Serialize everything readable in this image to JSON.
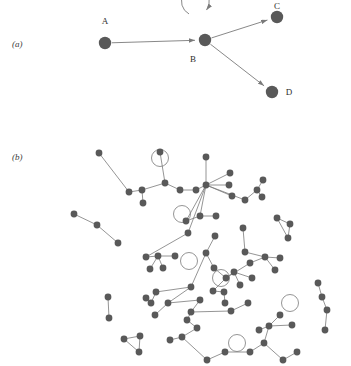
{
  "figure": {
    "width": 351,
    "height": 366,
    "background": "#ffffff",
    "node_color": "#595959",
    "edge_color": "#7a7a7a",
    "label_color": "#2e2e2e",
    "panel_label_color": "#3a3a3a"
  },
  "panels": [
    {
      "id": "a",
      "label": "(a)",
      "label_x": 12,
      "label_y": 47,
      "description": "directed graph with four labelled vertices and a self-loop",
      "node_radius": 6.2,
      "edge_width": 0.9,
      "nodes": [
        {
          "id": "A",
          "label": "A",
          "x": 105,
          "y": 43,
          "label_x": 105,
          "label_y": 24,
          "label_anchor": "middle"
        },
        {
          "id": "B",
          "label": "B",
          "x": 205,
          "y": 40,
          "label_x": 193,
          "label_y": 62,
          "label_anchor": "middle"
        },
        {
          "id": "C",
          "label": "C",
          "x": 277,
          "y": 17,
          "label_x": 277,
          "label_y": 9,
          "label_anchor": "middle"
        },
        {
          "id": "D",
          "label": "D",
          "x": 272,
          "y": 92,
          "label_x": 289,
          "label_y": 95,
          "label_anchor": "middle"
        }
      ],
      "edges": [
        {
          "from": "A",
          "to": "B",
          "directed": true
        },
        {
          "from": "B",
          "to": "C",
          "directed": true
        },
        {
          "from": "B",
          "to": "D",
          "directed": true
        },
        {
          "from": "B",
          "to": "B",
          "directed": true,
          "self_loop": true,
          "loop_radius": 14,
          "loop_cx": 200,
          "loop_cy": 22
        }
      ]
    },
    {
      "id": "b",
      "label": "(b)",
      "label_x": 12,
      "label_y": 160,
      "description": "large undirected network with many components, hubs, triangles and self-loops",
      "node_radius": 3.4,
      "edge_width": 0.8,
      "loop_radius": 8.5,
      "nodes": [
        {
          "id": 0,
          "x": 99,
          "y": 153
        },
        {
          "id": 1,
          "x": 160,
          "y": 152
        },
        {
          "id": 2,
          "x": 206,
          "y": 157
        },
        {
          "id": 3,
          "x": 129,
          "y": 192
        },
        {
          "id": 4,
          "x": 142,
          "y": 190
        },
        {
          "id": 5,
          "x": 143,
          "y": 203
        },
        {
          "id": 6,
          "x": 165,
          "y": 183
        },
        {
          "id": 7,
          "x": 180,
          "y": 190
        },
        {
          "id": 8,
          "x": 196,
          "y": 190
        },
        {
          "id": 9,
          "x": 206,
          "y": 185
        },
        {
          "id": 10,
          "x": 230,
          "y": 173
        },
        {
          "id": 11,
          "x": 229,
          "y": 185
        },
        {
          "id": 12,
          "x": 232,
          "y": 196
        },
        {
          "id": 13,
          "x": 245,
          "y": 200
        },
        {
          "id": 14,
          "x": 257,
          "y": 190
        },
        {
          "id": 15,
          "x": 263,
          "y": 180
        },
        {
          "id": 16,
          "x": 262,
          "y": 197
        },
        {
          "id": 17,
          "x": 74,
          "y": 214
        },
        {
          "id": 18,
          "x": 97,
          "y": 225
        },
        {
          "id": 19,
          "x": 118,
          "y": 243
        },
        {
          "id": 20,
          "x": 200,
          "y": 216
        },
        {
          "id": 21,
          "x": 186,
          "y": 221
        },
        {
          "id": 22,
          "x": 216,
          "y": 216
        },
        {
          "id": 23,
          "x": 188,
          "y": 233
        },
        {
          "id": 24,
          "x": 277,
          "y": 218
        },
        {
          "id": 25,
          "x": 290,
          "y": 224
        },
        {
          "id": 26,
          "x": 288,
          "y": 238
        },
        {
          "id": 27,
          "x": 146,
          "y": 257
        },
        {
          "id": 28,
          "x": 158,
          "y": 256
        },
        {
          "id": 29,
          "x": 175,
          "y": 256
        },
        {
          "id": 30,
          "x": 150,
          "y": 269
        },
        {
          "id": 31,
          "x": 163,
          "y": 268
        },
        {
          "id": 32,
          "x": 245,
          "y": 252
        },
        {
          "id": 33,
          "x": 265,
          "y": 257
        },
        {
          "id": 34,
          "x": 250,
          "y": 263
        },
        {
          "id": 35,
          "x": 280,
          "y": 258
        },
        {
          "id": 36,
          "x": 275,
          "y": 270
        },
        {
          "id": 37,
          "x": 226,
          "y": 278
        },
        {
          "id": 38,
          "x": 234,
          "y": 272
        },
        {
          "id": 39,
          "x": 240,
          "y": 285
        },
        {
          "id": 40,
          "x": 252,
          "y": 278
        },
        {
          "id": 41,
          "x": 213,
          "y": 291
        },
        {
          "id": 42,
          "x": 224,
          "y": 292
        },
        {
          "id": 43,
          "x": 225,
          "y": 303
        },
        {
          "id": 44,
          "x": 146,
          "y": 298
        },
        {
          "id": 45,
          "x": 151,
          "y": 303
        },
        {
          "id": 46,
          "x": 156,
          "y": 292
        },
        {
          "id": 47,
          "x": 191,
          "y": 287
        },
        {
          "id": 48,
          "x": 168,
          "y": 303
        },
        {
          "id": 49,
          "x": 155,
          "y": 315
        },
        {
          "id": 50,
          "x": 200,
          "y": 300
        },
        {
          "id": 51,
          "x": 191,
          "y": 312
        },
        {
          "id": 52,
          "x": 231,
          "y": 311
        },
        {
          "id": 53,
          "x": 248,
          "y": 303
        },
        {
          "id": 54,
          "x": 108,
          "y": 297
        },
        {
          "id": 55,
          "x": 109,
          "y": 318
        },
        {
          "id": 56,
          "x": 124,
          "y": 339
        },
        {
          "id": 57,
          "x": 140,
          "y": 336
        },
        {
          "id": 58,
          "x": 139,
          "y": 352
        },
        {
          "id": 59,
          "x": 182,
          "y": 337
        },
        {
          "id": 60,
          "x": 197,
          "y": 328
        },
        {
          "id": 61,
          "x": 207,
          "y": 360
        },
        {
          "id": 62,
          "x": 225,
          "y": 352
        },
        {
          "id": 63,
          "x": 250,
          "y": 352
        },
        {
          "id": 64,
          "x": 264,
          "y": 343
        },
        {
          "id": 65,
          "x": 283,
          "y": 360
        },
        {
          "id": 66,
          "x": 269,
          "y": 326
        },
        {
          "id": 67,
          "x": 280,
          "y": 315
        },
        {
          "id": 68,
          "x": 292,
          "y": 325
        },
        {
          "id": 69,
          "x": 259,
          "y": 330
        },
        {
          "id": 70,
          "x": 318,
          "y": 283
        },
        {
          "id": 71,
          "x": 322,
          "y": 297
        },
        {
          "id": 72,
          "x": 327,
          "y": 310
        },
        {
          "id": 73,
          "x": 325,
          "y": 330
        },
        {
          "id": 74,
          "x": 187,
          "y": 320
        },
        {
          "id": 75,
          "x": 215,
          "y": 236
        },
        {
          "id": 76,
          "x": 214,
          "y": 268
        },
        {
          "id": 77,
          "x": 206,
          "y": 253
        },
        {
          "id": 78,
          "x": 243,
          "y": 228
        },
        {
          "id": 79,
          "x": 170,
          "y": 340
        },
        {
          "id": 80,
          "x": 297,
          "y": 352
        }
      ],
      "edges": [
        [
          0,
          3
        ],
        [
          3,
          4
        ],
        [
          4,
          5
        ],
        [
          4,
          6
        ],
        [
          6,
          1
        ],
        [
          6,
          7
        ],
        [
          7,
          8
        ],
        [
          8,
          9
        ],
        [
          9,
          2
        ],
        [
          9,
          10
        ],
        [
          9,
          11
        ],
        [
          9,
          12
        ],
        [
          9,
          13
        ],
        [
          9,
          20
        ],
        [
          9,
          21
        ],
        [
          9,
          23
        ],
        [
          13,
          14
        ],
        [
          14,
          15
        ],
        [
          14,
          16
        ],
        [
          17,
          18
        ],
        [
          18,
          19
        ],
        [
          21,
          20
        ],
        [
          20,
          22
        ],
        [
          24,
          25
        ],
        [
          25,
          26
        ],
        [
          26,
          24
        ],
        [
          23,
          27
        ],
        [
          27,
          28
        ],
        [
          28,
          29
        ],
        [
          28,
          30
        ],
        [
          28,
          31
        ],
        [
          32,
          33
        ],
        [
          33,
          35
        ],
        [
          33,
          36
        ],
        [
          33,
          34
        ],
        [
          34,
          37
        ],
        [
          37,
          38
        ],
        [
          38,
          39
        ],
        [
          38,
          40
        ],
        [
          37,
          41
        ],
        [
          41,
          42
        ],
        [
          42,
          43
        ],
        [
          44,
          45
        ],
        [
          45,
          46
        ],
        [
          46,
          47
        ],
        [
          47,
          48
        ],
        [
          48,
          49
        ],
        [
          48,
          50
        ],
        [
          50,
          51
        ],
        [
          51,
          52
        ],
        [
          52,
          53
        ],
        [
          54,
          55
        ],
        [
          56,
          57
        ],
        [
          57,
          58
        ],
        [
          58,
          56
        ],
        [
          59,
          60
        ],
        [
          60,
          74
        ],
        [
          59,
          61
        ],
        [
          61,
          62
        ],
        [
          62,
          63
        ],
        [
          63,
          64
        ],
        [
          64,
          65
        ],
        [
          64,
          66
        ],
        [
          66,
          67
        ],
        [
          66,
          68
        ],
        [
          66,
          69
        ],
        [
          70,
          71
        ],
        [
          71,
          72
        ],
        [
          72,
          73
        ],
        [
          75,
          77
        ],
        [
          77,
          76
        ],
        [
          76,
          37
        ],
        [
          78,
          32
        ],
        [
          79,
          59
        ],
        [
          65,
          80
        ],
        [
          74,
          51
        ],
        [
          47,
          77
        ]
      ],
      "self_loops": [
        {
          "node": 1,
          "cx": 160,
          "cy": 158,
          "position": "above"
        },
        {
          "node": 9,
          "cx": 182,
          "cy": 214,
          "position": "left"
        },
        {
          "node": 29,
          "cx": 189,
          "cy": 261,
          "position": "right"
        },
        {
          "node": 46,
          "cx": 221,
          "cy": 278,
          "position": "above"
        },
        {
          "node": 53,
          "cx": 290,
          "cy": 303,
          "position": "right"
        },
        {
          "node": 57,
          "cx": 237,
          "cy": 343,
          "position": "above"
        }
      ]
    }
  ]
}
